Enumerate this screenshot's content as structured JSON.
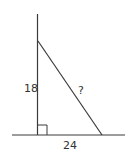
{
  "diagram": {
    "type": "right-triangle",
    "labels": {
      "vertical_leg": "18",
      "horizontal_leg": "24",
      "hypotenuse": "?"
    },
    "colors": {
      "stroke": "#3a3a3a",
      "text": "#333333",
      "background": "#ffffff"
    }
  }
}
